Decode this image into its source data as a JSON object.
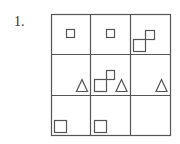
{
  "problem": {
    "number_label": "1.",
    "grid": {
      "rows": 3,
      "cols": 3,
      "line_color": "#555555",
      "shape_color": "#555555"
    },
    "cells": [
      {
        "row": 0,
        "col": 0,
        "shapes": [
          "small-square"
        ]
      },
      {
        "row": 0,
        "col": 1,
        "shapes": [
          "small-square"
        ]
      },
      {
        "row": 0,
        "col": 2,
        "shapes": [
          "small-square",
          "large-square"
        ]
      },
      {
        "row": 1,
        "col": 0,
        "shapes": [
          "triangle"
        ]
      },
      {
        "row": 1,
        "col": 1,
        "shapes": [
          "small-square",
          "large-square",
          "triangle"
        ]
      },
      {
        "row": 1,
        "col": 2,
        "shapes": [
          "triangle"
        ]
      },
      {
        "row": 2,
        "col": 0,
        "shapes": [
          "large-square"
        ]
      },
      {
        "row": 2,
        "col": 1,
        "shapes": [
          "large-square"
        ]
      },
      {
        "row": 2,
        "col": 2,
        "shapes": []
      }
    ]
  }
}
